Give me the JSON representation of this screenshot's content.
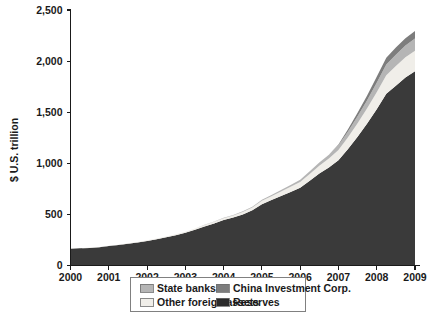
{
  "chart_data": {
    "type": "area",
    "stacked": true,
    "title": "",
    "subtitle": "",
    "xlabel": "",
    "ylabel": "$ U.S. trillion",
    "xlim": [
      2000,
      2009
    ],
    "ylim": [
      0,
      2500
    ],
    "ytick_labels": [
      "0",
      "500",
      "1,000",
      "1,500",
      "2,000",
      "2,500"
    ],
    "ytick_values": [
      0,
      500,
      1000,
      1500,
      2000,
      2500
    ],
    "xtick_labels": [
      "2000",
      "2001",
      "2002",
      "2003",
      "2004",
      "2005",
      "2006",
      "2007",
      "2008",
      "2009"
    ],
    "xtick_values": [
      2000,
      2001,
      2002,
      2003,
      2004,
      2005,
      2006,
      2007,
      2008,
      2009
    ],
    "grid": false,
    "legend_position": "bottom",
    "x": [
      2000,
      2000.25,
      2000.5,
      2000.75,
      2001,
      2001.25,
      2001.5,
      2001.75,
      2002,
      2002.25,
      2002.5,
      2002.75,
      2003,
      2003.25,
      2003.5,
      2003.75,
      2004,
      2004.25,
      2004.5,
      2004.75,
      2005,
      2005.25,
      2005.5,
      2005.75,
      2006,
      2006.25,
      2006.5,
      2006.75,
      2007,
      2007.25,
      2007.5,
      2007.75,
      2008,
      2008.25,
      2008.5,
      2008.75,
      2009
    ],
    "series": [
      {
        "name": "Reserves",
        "color": "#3a3a3a",
        "values": [
          165,
          168,
          172,
          178,
          190,
          200,
          212,
          225,
          240,
          258,
          276,
          296,
          320,
          350,
          382,
          412,
          445,
          470,
          500,
          540,
          600,
          640,
          680,
          720,
          760,
          830,
          900,
          960,
          1030,
          1140,
          1260,
          1390,
          1530,
          1680,
          1760,
          1840,
          1900
        ],
        "ylabel_units": "billion"
      },
      {
        "name": "Other foreign assets",
        "color": "#f0eee9",
        "values": [
          2,
          2,
          3,
          3,
          4,
          4,
          5,
          5,
          6,
          7,
          8,
          9,
          10,
          12,
          14,
          16,
          18,
          20,
          24,
          28,
          34,
          38,
          44,
          50,
          58,
          66,
          76,
          86,
          100,
          116,
          132,
          148,
          166,
          182,
          192,
          198,
          202
        ]
      },
      {
        "name": "State banks",
        "color": "#b5b5b5",
        "values": [
          0,
          0,
          0,
          0,
          0,
          0,
          0,
          0,
          0,
          0,
          0,
          0,
          0,
          1,
          2,
          3,
          4,
          5,
          6,
          8,
          10,
          12,
          15,
          18,
          22,
          26,
          32,
          38,
          46,
          56,
          68,
          80,
          92,
          104,
          110,
          114,
          118
        ]
      },
      {
        "name": "China Investment Corp.",
        "color": "#7d7d7d",
        "values": [
          0,
          0,
          0,
          0,
          0,
          0,
          0,
          0,
          0,
          0,
          0,
          0,
          0,
          0,
          0,
          0,
          0,
          0,
          0,
          0,
          0,
          0,
          0,
          0,
          0,
          0,
          0,
          0,
          8,
          20,
          34,
          46,
          58,
          66,
          70,
          72,
          74
        ]
      }
    ],
    "legend_entries": [
      {
        "label": "State banks",
        "color": "#b5b5b5"
      },
      {
        "label": "China Investment Corp.",
        "color": "#7d7d7d"
      },
      {
        "label": "Other foreign assets",
        "color": "#f0eee9"
      },
      {
        "label": "Reserves",
        "color": "#2b2b2b"
      }
    ]
  }
}
